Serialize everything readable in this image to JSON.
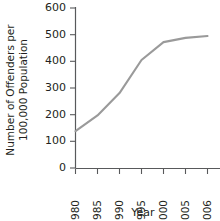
{
  "chart_data": {
    "type": "line",
    "title": "",
    "xlabel": "Year",
    "ylabel": "Number of Offenders per 100,000 Population",
    "ylabel_line1": "Number of Offenders per",
    "ylabel_line2": "100,000 Population",
    "x": [
      1980,
      1985,
      1990,
      1995,
      2000,
      2005,
      2006
    ],
    "categories": [
      "1980",
      "1985",
      "1990",
      "1995",
      "2000",
      "2005",
      "2006"
    ],
    "values": [
      138,
      197,
      281,
      405,
      472,
      488,
      495
    ],
    "series": [
      {
        "name": "Offenders per 100,000 Population",
        "values": [
          138,
          197,
          281,
          405,
          472,
          488,
          495
        ]
      }
    ],
    "xlim": [
      1980,
      2006
    ],
    "ylim": [
      0,
      600
    ],
    "yticks": [
      0,
      100,
      200,
      300,
      400,
      500,
      600
    ],
    "ytick_labels": [
      "0",
      "100",
      "200",
      "300",
      "400",
      "500",
      "600"
    ],
    "xticks": [
      1980,
      1985,
      1990,
      1995,
      2000,
      2005,
      2006
    ],
    "xtick_labels": [
      "1980",
      "1985",
      "1990",
      "1995",
      "2000",
      "2005",
      "2006"
    ],
    "xtick_rotation": 90,
    "grid": false,
    "legend": false,
    "legend_position": "none",
    "line_color": "#9a9a9a",
    "axis_color": "#58595b",
    "text_color": "#231f20",
    "background_color": "#ffffff"
  }
}
